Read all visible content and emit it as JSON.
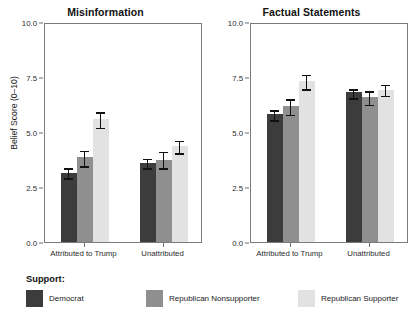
{
  "chart_data": {
    "type": "bar",
    "title": "",
    "xlabel": "",
    "ylabel": "Belief Score (0–10)",
    "ylim": [
      0,
      10
    ],
    "ytick_labels": [
      "0.0",
      "2.5",
      "5.0",
      "7.5",
      "10.0"
    ],
    "ytick_values": [
      0,
      2.5,
      5,
      7.5,
      10
    ],
    "grid": false,
    "legend_position": "bottom-left",
    "legend_title": "Support:",
    "categories": [
      "Attributed to Trump",
      "Unattributed"
    ],
    "series": [
      {
        "name": "Democrat",
        "color": "#3c3c3c"
      },
      {
        "name": "Republican Nonsupporter",
        "color": "#8f8f8f"
      },
      {
        "name": "Republican Supporter",
        "color": "#e2e2e2"
      }
    ],
    "panels": [
      {
        "title": "Misinformation",
        "groups": [
          {
            "category": "Attributed to Trump",
            "bars": [
              {
                "series": "Democrat",
                "value": 3.15,
                "err_low": 2.95,
                "err_high": 3.4
              },
              {
                "series": "Republican Nonsupporter",
                "value": 3.85,
                "err_low": 3.5,
                "err_high": 4.2
              },
              {
                "series": "Republican Supporter",
                "value": 5.6,
                "err_low": 5.25,
                "err_high": 5.95
              }
            ]
          },
          {
            "category": "Unattributed",
            "bars": [
              {
                "series": "Democrat",
                "value": 3.6,
                "err_low": 3.4,
                "err_high": 3.85
              },
              {
                "series": "Republican Nonsupporter",
                "value": 3.75,
                "err_low": 3.4,
                "err_high": 4.15
              },
              {
                "series": "Republican Supporter",
                "value": 4.35,
                "err_low": 4.1,
                "err_high": 4.65
              }
            ]
          }
        ]
      },
      {
        "title": "Factual Statements",
        "groups": [
          {
            "category": "Attributed to Trump",
            "bars": [
              {
                "series": "Democrat",
                "value": 5.8,
                "err_low": 5.6,
                "err_high": 6.05
              },
              {
                "series": "Republican Nonsupporter",
                "value": 6.2,
                "err_low": 5.85,
                "err_high": 6.55
              },
              {
                "series": "Republican Supporter",
                "value": 7.3,
                "err_low": 7.0,
                "err_high": 7.65
              }
            ]
          },
          {
            "category": "Unattributed",
            "bars": [
              {
                "series": "Democrat",
                "value": 6.8,
                "err_low": 6.6,
                "err_high": 7.0
              },
              {
                "series": "Republican Nonsupporter",
                "value": 6.6,
                "err_low": 6.3,
                "err_high": 6.9
              },
              {
                "series": "Republican Supporter",
                "value": 6.9,
                "err_low": 6.7,
                "err_high": 7.2
              }
            ]
          }
        ]
      }
    ]
  }
}
